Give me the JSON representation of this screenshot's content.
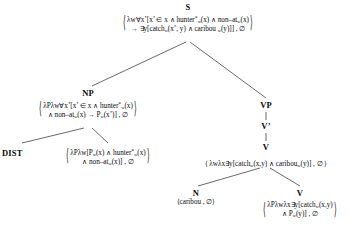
{
  "diagram": {
    "type": "syntax-semantics-derivation-tree",
    "brackets": {
      "open": "⟨",
      "close": "⟩"
    },
    "empty_set": "∅",
    "nodes": {
      "s": {
        "label": "S",
        "sem_line1": "⟨λw∀x’[x’ ∈ x ∧ hunter*w(x) ∧ non–atw(x)",
        "sem_line2": "→ ∃y[catchw(x’, y) ∧ caribou w(y)]] , ∅⟩"
      },
      "np": {
        "label": "NP",
        "sem_line1": "⟨λPλw∀x’[x’ ∈ x ∧ hunter*w(x)",
        "sem_line2": "∧ non–atw(x) → Pw(x’)] , ∅⟩"
      },
      "dist": {
        "label": "DIST",
        "sem_line1": "⟨λPλw[Pw(x) ∧ hunter*w(x)",
        "sem_line2": "∧ non–atw(x)] , ∅⟩"
      },
      "vp": {
        "label": "VP"
      },
      "vbar": {
        "label": "V’"
      },
      "v_upper": {
        "label": "V",
        "sem_line1": "⟨λwλx∃y[catchw(x,y) ∧ caribouw(y)] , ∅⟩"
      },
      "n": {
        "label": "N",
        "sem_line1": "⟨caribou , ∅⟩"
      },
      "v_lower": {
        "label": "V",
        "sem_line1": "⟨λPλwλx∃y[catchw(x,y)",
        "sem_line2": "∧ Pw(y)] , ∅⟩"
      }
    }
  }
}
